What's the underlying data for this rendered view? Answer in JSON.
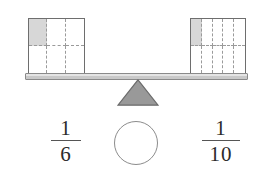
{
  "diagram": {
    "type": "balance-scale-fraction-comparison",
    "title": "",
    "background_color": "#ffffff"
  },
  "colors": {
    "shaded_cell": "#d7d7d7",
    "model_border": "#6e6e6e",
    "grid_line": "#9a9a9a",
    "beam_fill": "#c9c9c9",
    "beam_border": "#8a8a8a",
    "fulcrum_fill": "#999999",
    "fulcrum_border": "#6b6b6b",
    "circle_border": "#8c8c8c",
    "text": "#2b2b2b"
  },
  "left_pan": {
    "model": {
      "name": "fraction-model-one-sixth",
      "columns": 3,
      "rows": 2,
      "total_cells": 6,
      "shaded_cells": 1,
      "shaded_indices": [
        0
      ]
    },
    "fraction": {
      "numerator": "1",
      "denominator": "6",
      "value": "1/6"
    }
  },
  "right_pan": {
    "model": {
      "name": "fraction-model-one-tenth",
      "columns": 5,
      "rows": 2,
      "total_cells": 10,
      "shaded_cells": 1,
      "shaded_indices": [
        0
      ]
    },
    "fraction": {
      "numerator": "1",
      "denominator": "10",
      "value": "1/10"
    }
  },
  "balance": {
    "beam_label": "balance-beam",
    "tilt": "level",
    "fulcrum_label": "fulcrum-triangle"
  },
  "comparison": {
    "answer_placeholder": "",
    "hint": "circle-blank-for-comparison-symbol"
  }
}
